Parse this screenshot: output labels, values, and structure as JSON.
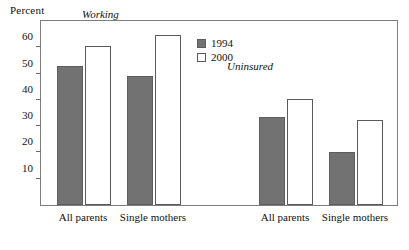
{
  "chart_data": {
    "type": "bar",
    "title": "",
    "xlabel": "",
    "ylabel": "Percent",
    "ylim": [
      0,
      70
    ],
    "yticks": [
      10,
      20,
      30,
      40,
      50,
      60
    ],
    "grid": false,
    "legend_position": "top-center",
    "series": [
      {
        "name": "1994",
        "color": "#727272"
      },
      {
        "name": "2000",
        "color": "#ffffff"
      }
    ],
    "panels": [
      {
        "name": "Working",
        "categories": [
          "All parents",
          "Single mothers"
        ],
        "series": [
          {
            "name": "1994",
            "values": [
              53,
              49
            ]
          },
          {
            "name": "2000",
            "values": [
              60.5,
              64.5
            ]
          }
        ]
      },
      {
        "name": "Uninsured",
        "categories": [
          "All parents",
          "Single mothers"
        ],
        "series": [
          {
            "name": "1994",
            "values": [
              33.5,
              20
            ]
          },
          {
            "name": "2000",
            "values": [
              40.5,
              32.5
            ]
          }
        ]
      }
    ]
  },
  "axis": {
    "y_title": "Percent",
    "tick_labels": [
      "60",
      "50",
      "40",
      "30",
      "20",
      "10"
    ]
  },
  "panel_titles": {
    "working": "Working",
    "uninsured": "Uninsured"
  },
  "legend": {
    "items": [
      {
        "label": "1994",
        "swatch": "filled-gray-square"
      },
      {
        "label": "2000",
        "swatch": "open-white-square"
      }
    ]
  },
  "group_labels": {
    "working_all_parents": "All parents",
    "working_single_mothers": "Single mothers",
    "uninsured_all_parents": "All parents",
    "uninsured_single_mothers": "Single mothers"
  },
  "colors": {
    "bar_1994": "#727272",
    "bar_2000": "#ffffff",
    "frame": "#7e7e7e",
    "text": "#111111"
  }
}
